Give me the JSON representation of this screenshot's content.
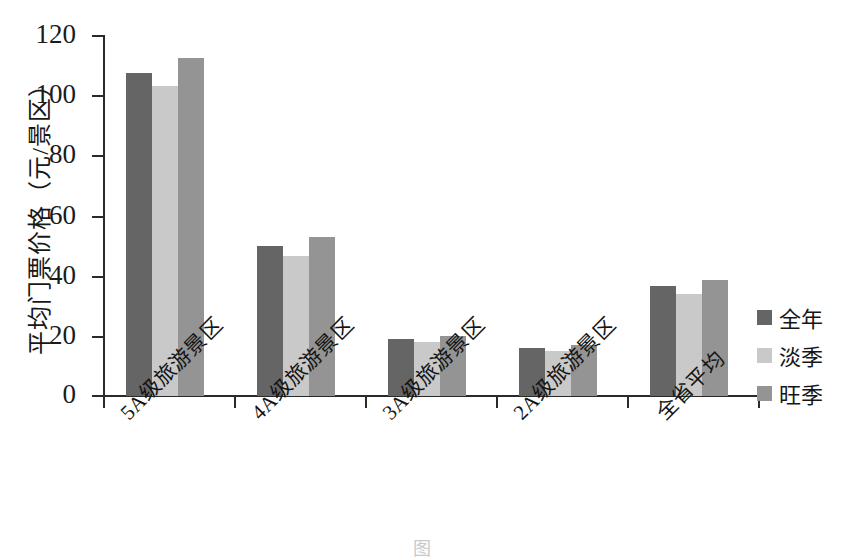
{
  "chart_data": {
    "type": "bar",
    "title": "",
    "subtitle": "",
    "xlabel": "",
    "ylabel": "平均门票价格（元/景区）",
    "ylim": [
      0,
      120
    ],
    "yticks": [
      0,
      20,
      40,
      60,
      80,
      100,
      120
    ],
    "grid": false,
    "legend_position": "right",
    "categories": [
      "5A级旅游景区",
      "4A级旅游景区",
      "3A级旅游景区",
      "2A级旅游景区",
      "全省平均"
    ],
    "series": [
      {
        "name": "全年",
        "color": "#656565",
        "values": [
          107.5,
          50.0,
          19.0,
          16.0,
          36.5
        ]
      },
      {
        "name": "淡季",
        "color": "#c9c9c9",
        "values": [
          103.0,
          46.5,
          18.0,
          15.0,
          34.0
        ]
      },
      {
        "name": "旺季",
        "color": "#949494",
        "values": [
          112.5,
          53.0,
          20.0,
          17.0,
          38.5
        ]
      }
    ]
  },
  "axis": {
    "y_title": "平均门票价格（元/景区）",
    "y_tick_labels": [
      "120",
      "100",
      "80",
      "60",
      "40",
      "20",
      "0"
    ]
  },
  "legend": {
    "items": [
      {
        "label": "全年"
      },
      {
        "label": "淡季"
      },
      {
        "label": "旺季"
      }
    ]
  },
  "caption": {
    "text": "图　　　　　　　　　　　　　　　　　　　　　　"
  }
}
